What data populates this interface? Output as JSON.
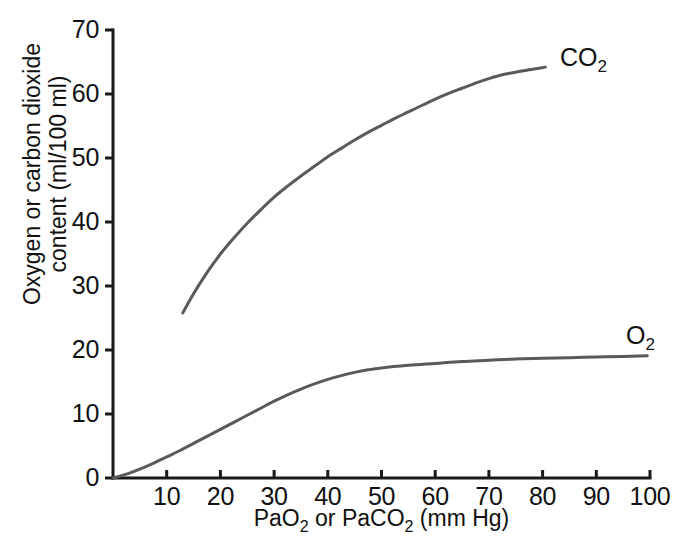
{
  "chart_data": {
    "type": "line",
    "title": "",
    "subtitle": "",
    "xlabel": "PaO₂ or PaCO₂ (mm Hg)",
    "xlabel_parts": {
      "pre": "PaO",
      "sub1": "2",
      "mid": " or PaCO",
      "sub2": "2",
      "post": " (mm Hg)"
    },
    "ylabel_line1": "Oxygen or carbon dioxide",
    "ylabel_line2": "content (ml/100 ml)",
    "ylabel": "Oxygen or carbon dioxide content (ml/100 ml)",
    "xlim": [
      0,
      100
    ],
    "ylim": [
      0,
      70
    ],
    "xticks": [
      10,
      20,
      30,
      40,
      50,
      60,
      70,
      80,
      90,
      100
    ],
    "xtick_labels": [
      "10",
      "20",
      "30",
      "40",
      "50",
      "60",
      "70",
      "80",
      "90",
      "100"
    ],
    "yticks": [
      0,
      10,
      20,
      30,
      40,
      50,
      60,
      70
    ],
    "ytick_labels": [
      "0",
      "10",
      "20",
      "30",
      "40",
      "50",
      "60",
      "70"
    ],
    "grid": false,
    "legend_position": "inline-annotation",
    "line_color": "#5a5a5a",
    "axis_color": "#1a1a1a",
    "series": [
      {
        "name": "CO2",
        "label_text": "CO",
        "label_sub": "2",
        "color": "#5a5a5a",
        "points": [
          [
            13.0,
            25.8
          ],
          [
            15.0,
            28.8
          ],
          [
            17.5,
            32.1
          ],
          [
            20.0,
            35.0
          ],
          [
            22.5,
            37.5
          ],
          [
            25.0,
            39.8
          ],
          [
            27.5,
            41.9
          ],
          [
            30.0,
            43.9
          ],
          [
            32.5,
            45.6
          ],
          [
            35.0,
            47.2
          ],
          [
            37.5,
            48.7
          ],
          [
            40.0,
            50.2
          ],
          [
            42.5,
            51.5
          ],
          [
            45.0,
            52.8
          ],
          [
            47.5,
            54.0
          ],
          [
            50.0,
            55.1
          ],
          [
            52.5,
            56.2
          ],
          [
            55.0,
            57.2
          ],
          [
            57.5,
            58.2
          ],
          [
            60.0,
            59.2
          ],
          [
            62.5,
            60.1
          ],
          [
            65.0,
            60.9
          ],
          [
            67.5,
            61.7
          ],
          [
            70.0,
            62.4
          ],
          [
            72.5,
            63.0
          ],
          [
            75.0,
            63.4
          ],
          [
            77.5,
            63.8
          ],
          [
            80.5,
            64.2
          ]
        ]
      },
      {
        "name": "O2",
        "label_text": "O",
        "label_sub": "2",
        "color": "#5a5a5a",
        "points": [
          [
            0.0,
            0.0
          ],
          [
            2.5,
            0.6
          ],
          [
            5.0,
            1.4
          ],
          [
            7.5,
            2.3
          ],
          [
            10.0,
            3.3
          ],
          [
            12.5,
            4.3
          ],
          [
            15.0,
            5.4
          ],
          [
            17.5,
            6.5
          ],
          [
            20.0,
            7.6
          ],
          [
            22.5,
            8.7
          ],
          [
            25.0,
            9.8
          ],
          [
            27.5,
            10.9
          ],
          [
            30.0,
            12.0
          ],
          [
            32.5,
            13.0
          ],
          [
            35.0,
            13.9
          ],
          [
            37.5,
            14.7
          ],
          [
            40.0,
            15.4
          ],
          [
            42.5,
            16.0
          ],
          [
            45.0,
            16.5
          ],
          [
            47.5,
            16.9
          ],
          [
            50.0,
            17.2
          ],
          [
            55.0,
            17.6
          ],
          [
            60.0,
            17.9
          ],
          [
            65.0,
            18.2
          ],
          [
            70.0,
            18.4
          ],
          [
            75.0,
            18.6
          ],
          [
            80.0,
            18.7
          ],
          [
            85.0,
            18.8
          ],
          [
            90.0,
            18.9
          ],
          [
            95.0,
            19.0
          ],
          [
            99.5,
            19.1
          ]
        ]
      }
    ],
    "annotations": [
      {
        "text": "CO2",
        "x_px": 560,
        "y_px": 45
      },
      {
        "text": "O2",
        "x_px": 626,
        "y_px": 323
      }
    ]
  },
  "axes_geometry": {
    "x_origin_px": 113,
    "y_origin_px": 478,
    "x_scale_px_per_unit": 5.37,
    "y_scale_px_per_unit": 6.4,
    "tick_length_px": 8
  }
}
